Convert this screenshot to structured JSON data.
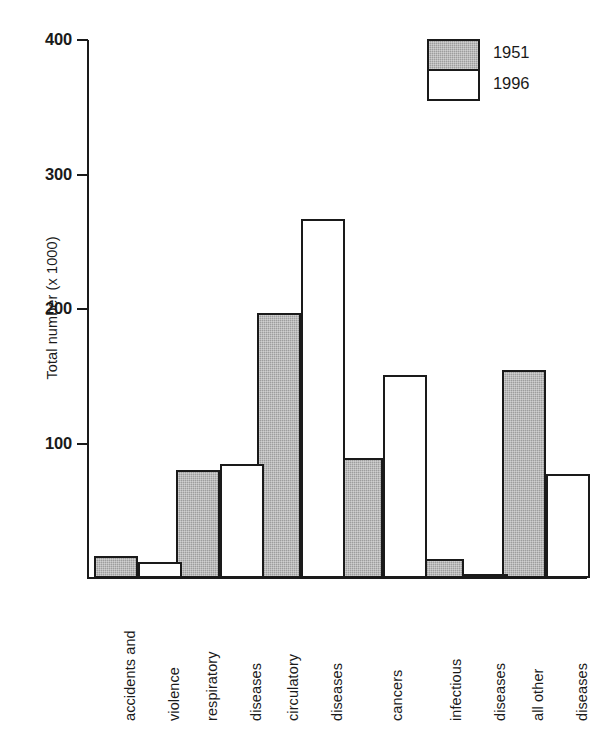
{
  "chart_data": {
    "type": "bar",
    "title": "",
    "xlabel": "",
    "ylabel": "Total number (x 1000)",
    "ylim": [
      0,
      400
    ],
    "yticks": [
      0,
      100,
      200,
      300,
      400
    ],
    "ytick_labels": [
      "100",
      "200",
      "300",
      "400"
    ],
    "grid": false,
    "legend_position": "top-right",
    "categories": [
      "accidents and violence",
      "respiratory diseases",
      "circulatory diseases",
      "cancers",
      "infectious diseases",
      "all other diseases"
    ],
    "category_lines": [
      [
        "accidents and",
        "violence"
      ],
      [
        "respiratory",
        "diseases"
      ],
      [
        "circulatory",
        "diseases"
      ],
      [
        "cancers"
      ],
      [
        "infectious",
        "diseases"
      ],
      [
        "all other",
        "diseases"
      ]
    ],
    "series": [
      {
        "name": "1951",
        "color": "#9d9d9d",
        "values": [
          16,
          80,
          197,
          89,
          14,
          155
        ]
      },
      {
        "name": "1996",
        "color": "#ffffff",
        "values": [
          12,
          85,
          267,
          151,
          3,
          77
        ]
      }
    ]
  },
  "legend": {
    "entries": [
      {
        "label": "1951",
        "swatch": "gray-hatched"
      },
      {
        "label": "1996",
        "swatch": "white"
      }
    ]
  },
  "axis": {
    "y_label": "Total number (x 1000)",
    "y_tick_400": "400",
    "y_tick_300": "300",
    "y_tick_200": "200",
    "y_tick_100": "100"
  }
}
